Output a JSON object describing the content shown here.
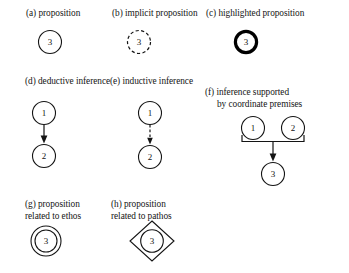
{
  "figure": {
    "background": "#ffffff",
    "ink": "#141414",
    "width": 349,
    "height": 273
  },
  "panels": [
    {
      "key": "a",
      "caption": "(a) proposition",
      "caption_line2": "",
      "shape": "circle",
      "style": "solid",
      "node_labels": [
        "3"
      ]
    },
    {
      "key": "b",
      "caption": "(b) implicit proposition",
      "caption_line2": "",
      "shape": "circle",
      "style": "dashed",
      "node_labels": [
        "3"
      ]
    },
    {
      "key": "c",
      "caption": "(c) highlighted proposition",
      "caption_line2": "",
      "shape": "circle",
      "style": "bold",
      "node_labels": [
        "3"
      ]
    },
    {
      "key": "d",
      "caption": "(d) deductive inference",
      "caption_line2": "",
      "shape": "two-nodes-arrow",
      "style": "solid-arrow",
      "node_labels": [
        "1",
        "2"
      ]
    },
    {
      "key": "e",
      "caption": "(e) inductive inference",
      "caption_line2": "",
      "shape": "two-nodes-arrow",
      "style": "dashed-arrow",
      "node_labels": [
        "1",
        "2"
      ]
    },
    {
      "key": "f",
      "caption": "(f) inference supported",
      "caption_line2": "by coordinate premises",
      "shape": "bracket-join",
      "style": "solid-arrow",
      "node_labels": [
        "1",
        "2",
        "3"
      ]
    },
    {
      "key": "g",
      "caption": "(g) proposition",
      "caption_line2": "related to ethos",
      "shape": "double-circle",
      "style": "solid",
      "node_labels": [
        "3"
      ]
    },
    {
      "key": "h",
      "caption": "(h) proposition",
      "caption_line2": "related to pathos",
      "shape": "circle-in-diamond",
      "style": "solid",
      "node_labels": [
        "3"
      ]
    }
  ]
}
